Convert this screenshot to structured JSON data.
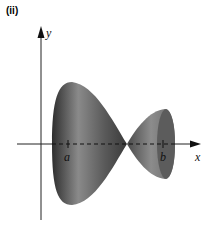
{
  "figure": {
    "panel_label": "(ii)",
    "y_axis_label": "y",
    "x_axis_label": "x",
    "tick_a_label": "a",
    "tick_b_label": "b",
    "colors": {
      "solid_dark": "#3a3a3a",
      "solid_light": "#9a9a9a",
      "axis": "#222222"
    }
  }
}
